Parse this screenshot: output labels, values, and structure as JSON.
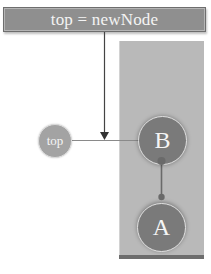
{
  "statement": {
    "code": "top = newNode"
  },
  "nodes": {
    "top_pointer": {
      "label": "top"
    },
    "b": {
      "label": "B"
    },
    "a": {
      "label": "A"
    }
  },
  "colors": {
    "code_box": "#8f8f8f",
    "panel": "#b9b9b9",
    "node_fill": "#7a7a7a",
    "pointer_fill": "#a3a3a3",
    "line": "#555555",
    "text": "#f5f5f5"
  }
}
